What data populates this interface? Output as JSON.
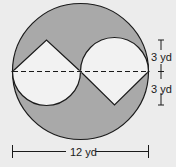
{
  "diagram": {
    "colors": {
      "background": "#ececec",
      "shaded": "#a9a9a9",
      "unshaded": "#f2f2f2",
      "stroke": "#1a1a1a"
    },
    "labels": {
      "upper_radius": "3 yd",
      "lower_radius": "3 yd",
      "diameter": "12 yd"
    }
  }
}
